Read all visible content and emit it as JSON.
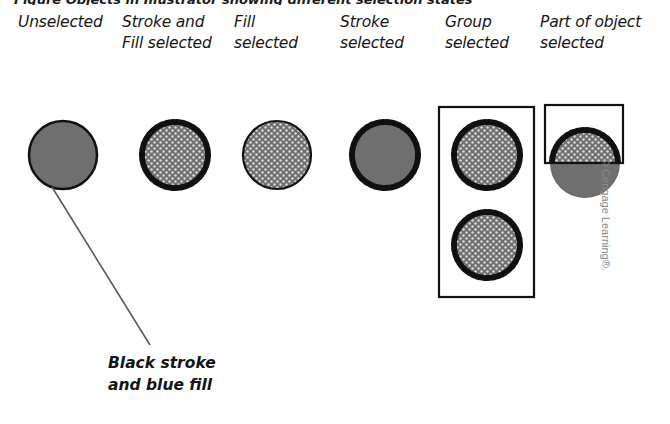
{
  "figure": {
    "cut_off_caption": "Figure  Objects in Illustrator showing different selection states",
    "callout_note": "Black stroke\nand blue fill",
    "credit": "© Cengage Learning®.",
    "colors": {
      "fill_gray": "#6f6f6f",
      "stroke_black": "#111111",
      "pattern_light": "#d8d8d8",
      "leader_line": "#5a5a5a",
      "bounding_box": "#111111",
      "page_background": "#ffffff"
    },
    "columns": [
      {
        "id": "unselected",
        "label": "Unselected",
        "label_x": 18,
        "state": {
          "fill": "solid",
          "stroke": "plain",
          "selected_fill": false,
          "selected_stroke": false
        },
        "shapes": [
          {
            "kind": "circle",
            "cx": 63,
            "cy": 155,
            "r": 34
          }
        ],
        "bounding_box": null,
        "leader_line": {
          "x1": 52,
          "y1": 187,
          "x2": 150,
          "y2": 345
        }
      },
      {
        "id": "stroke-and-fill-selected",
        "label": "Stroke and\nFill selected",
        "label_x": 122,
        "state": {
          "fill": "pattern",
          "stroke": "dotted-selected",
          "selected_fill": true,
          "selected_stroke": true
        },
        "shapes": [
          {
            "kind": "circle",
            "cx": 175,
            "cy": 155,
            "r": 34
          }
        ],
        "bounding_box": null,
        "leader_line": null
      },
      {
        "id": "fill-selected",
        "label": "Fill\nselected",
        "label_x": 234,
        "state": {
          "fill": "pattern",
          "stroke": "plain",
          "selected_fill": true,
          "selected_stroke": false
        },
        "shapes": [
          {
            "kind": "circle",
            "cx": 277,
            "cy": 155,
            "r": 34
          }
        ],
        "bounding_box": null,
        "leader_line": null
      },
      {
        "id": "stroke-selected",
        "label": "Stroke\nselected",
        "label_x": 340,
        "state": {
          "fill": "solid",
          "stroke": "dotted-selected",
          "selected_fill": false,
          "selected_stroke": true
        },
        "shapes": [
          {
            "kind": "circle",
            "cx": 385,
            "cy": 155,
            "r": 34
          }
        ],
        "bounding_box": null,
        "leader_line": null
      },
      {
        "id": "group-selected",
        "label": "Group\nselected",
        "label_x": 445,
        "state": {
          "fill": "pattern",
          "stroke": "dotted-selected",
          "selected_fill": true,
          "selected_stroke": true
        },
        "shapes": [
          {
            "kind": "circle",
            "cx": 487,
            "cy": 155,
            "r": 34
          },
          {
            "kind": "circle",
            "cx": 487,
            "cy": 245,
            "r": 34
          }
        ],
        "bounding_box": {
          "x": 439,
          "y": 107,
          "w": 95,
          "h": 190
        },
        "leader_line": null
      },
      {
        "id": "part-of-object-selected",
        "label": "Part of object\nselected",
        "label_x": 540,
        "state": {
          "fill": "partial-pattern",
          "stroke": "partial-dotted-selected",
          "selected_fill": "top-portion-only",
          "selected_stroke": "top-portion-only"
        },
        "shapes": [
          {
            "kind": "circle",
            "cx": 585,
            "cy": 163,
            "r": 34
          }
        ],
        "bounding_box": {
          "x": 545,
          "y": 105,
          "w": 78,
          "h": 58
        },
        "leader_line": null
      }
    ]
  }
}
